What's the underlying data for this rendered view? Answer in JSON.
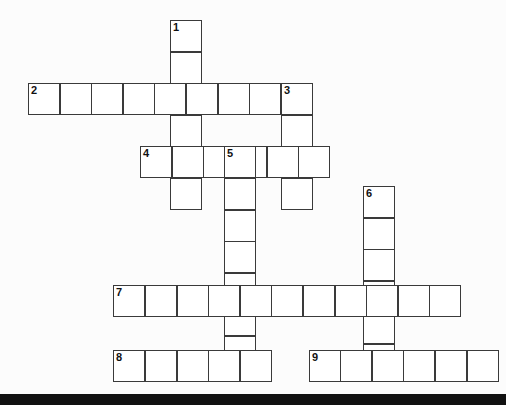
{
  "puzzle": {
    "kind": "crossword-grid",
    "background_color": "#fcfcfc",
    "cell_fill_color": "#ffffff",
    "cell_border_color": "#3a3a3a",
    "number_color": "#111111",
    "cell_size": 31.6,
    "bottom_bar": {
      "color": "#111111",
      "y": 394,
      "height": 11
    },
    "entries": [
      {
        "number": "1",
        "direction": "down",
        "length": 6,
        "col": 4.5,
        "row": 0
      },
      {
        "number": "2",
        "direction": "across",
        "length": 9,
        "col": 0,
        "row": 2
      },
      {
        "number": "3",
        "direction": "down",
        "length": 4,
        "col": 8,
        "row": 2
      },
      {
        "number": "4",
        "direction": "across",
        "length": 6,
        "col": 3.55,
        "row": 4
      },
      {
        "number": "5",
        "direction": "down",
        "length": 7,
        "col": 6.2,
        "row": 4
      },
      {
        "number": "6",
        "direction": "down",
        "length": 6,
        "col": 10.6,
        "row": 5.25
      },
      {
        "number": "7",
        "direction": "across",
        "length": 11,
        "col": 2.7,
        "row": 8.4
      },
      {
        "number": "8",
        "direction": "across",
        "length": 5,
        "col": 2.7,
        "row": 10.45
      },
      {
        "number": "9",
        "direction": "across",
        "length": 6,
        "col": 8.88,
        "row": 10.45
      }
    ]
  }
}
